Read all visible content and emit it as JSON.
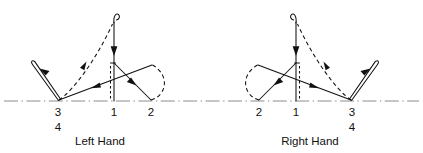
{
  "figure": {
    "background_color": "#ffffff",
    "ink_color": "#111111",
    "baseline_color": "#8d8d8d",
    "width": 423,
    "height": 153
  },
  "panels": [
    {
      "id": "left-hand",
      "caption": "Left Hand",
      "caption_x": 100,
      "caption_y": 142,
      "baseline_y": 101,
      "positions": [
        {
          "label": "3",
          "x": 58,
          "y": 115,
          "sublabel": "4",
          "sublabel_x": 58,
          "sublabel_y": 130
        },
        {
          "label": "1",
          "x": 114,
          "y": 115,
          "sublabel": null
        },
        {
          "label": "2",
          "x": 151,
          "y": 115,
          "sublabel": null
        }
      ],
      "paths": {
        "vertical_stem_top_y": 20,
        "hook_side": "right",
        "loop_side": "left",
        "dashed_arc_from": "3",
        "dashed_arc_to": "1-top",
        "loop_arc_near": "2"
      }
    },
    {
      "id": "right-hand",
      "caption": "Right Hand",
      "caption_x": 310,
      "caption_y": 142,
      "baseline_y": 101,
      "positions": [
        {
          "label": "2",
          "x": 259,
          "y": 115,
          "sublabel": null
        },
        {
          "label": "1",
          "x": 296,
          "y": 115,
          "sublabel": null
        },
        {
          "label": "3",
          "x": 352,
          "y": 115,
          "sublabel": "4",
          "sublabel_x": 352,
          "sublabel_y": 130
        }
      ],
      "paths": {
        "vertical_stem_top_y": 20,
        "hook_side": "left",
        "loop_side": "right",
        "dashed_arc_from": "3",
        "dashed_arc_to": "1-top",
        "loop_arc_near": "2"
      }
    }
  ],
  "baseline": {
    "y": 101,
    "x_start": 4,
    "x_end": 419,
    "style": "dash-dot"
  }
}
